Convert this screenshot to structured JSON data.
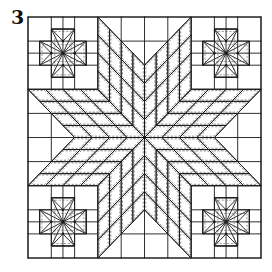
{
  "figure": {
    "number_label": "3",
    "colors": {
      "background": "#ffffff",
      "line": "#1a1a1a",
      "seam": "#444444"
    },
    "grid": {
      "origin_px": [
        28,
        17
      ],
      "size_px": [
        233,
        241
      ],
      "units": 10
    },
    "star": {
      "type": "eight-point lone star",
      "center_units": [
        5,
        5
      ],
      "arm_diagonal_offset_units": 2,
      "arm_straight_side_units": 3,
      "subdivisions_per_arm": 4,
      "arm_count": 8
    },
    "corner_blocks": {
      "type": "mini eight-point star",
      "positions_units": [
        [
          0,
          0
        ],
        [
          7,
          0
        ],
        [
          0,
          7
        ],
        [
          7,
          7
        ]
      ],
      "block_size_units": 3
    }
  }
}
